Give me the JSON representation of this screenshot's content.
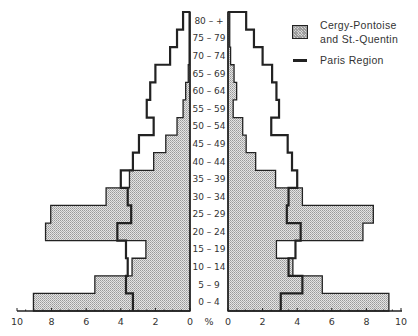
{
  "chart_data": {
    "type": "bar",
    "subtype": "population-pyramid",
    "title": "",
    "xlabel": "%",
    "ylabel": "",
    "xlim_left": [
      10,
      0
    ],
    "xlim_right": [
      0,
      10
    ],
    "x_ticks": [
      10,
      8,
      6,
      4,
      2,
      0
    ],
    "x_ticks_right": [
      0,
      2,
      4,
      6,
      8,
      10
    ],
    "axis_unit_label": "%",
    "grid": false,
    "legend_position": "upper-right",
    "categories": [
      "0 – 4",
      "5 – 9",
      "10 – 14",
      "15 – 19",
      "20 – 24",
      "25 – 29",
      "30 – 34",
      "35 – 39",
      "40 – 44",
      "45 – 49",
      "50 – 54",
      "55 – 59",
      "60 – 64",
      "65 – 69",
      "70 – 74",
      "75 – 79",
      "80 – +"
    ],
    "series": [
      {
        "name": "Cergy-Pontoise and St.-Quentin",
        "style": "shaded-bars",
        "left_values": [
          9.05,
          5.5,
          3.35,
          2.55,
          8.35,
          8.05,
          4.85,
          3.5,
          2.1,
          1.4,
          0.75,
          0.4,
          0.25,
          0.1,
          0.05,
          0.05,
          0.05
        ],
        "right_values": [
          9.3,
          5.45,
          3.75,
          2.8,
          7.8,
          8.4,
          4.3,
          2.75,
          1.6,
          1.05,
          0.85,
          0.3,
          0.5,
          0.35,
          0.15,
          0.1,
          0.1
        ]
      },
      {
        "name": "Paris Region",
        "style": "step-line",
        "left_values": [
          3.3,
          3.7,
          3.6,
          3.7,
          4.2,
          3.4,
          3.6,
          4.0,
          3.3,
          2.95,
          2.1,
          2.5,
          2.3,
          2.0,
          1.15,
          0.75,
          0.4
        ],
        "right_values": [
          3.05,
          4.3,
          3.5,
          3.9,
          4.2,
          3.4,
          3.5,
          4.0,
          3.7,
          3.45,
          2.5,
          2.95,
          2.8,
          2.55,
          2.0,
          1.5,
          1.05
        ]
      }
    ]
  },
  "legend": {
    "cergy_line1": "Cergy-Pontoise",
    "cergy_line2": "and St.-Quentin",
    "paris": "Paris Region"
  }
}
